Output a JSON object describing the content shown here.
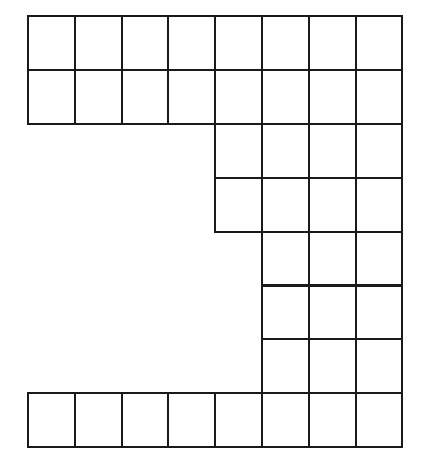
{
  "figure": {
    "background_color": "#ffffff",
    "line_color": "#1a1a1a",
    "line_width": 2.1,
    "origin_x": 28,
    "origin_y": 16,
    "cell_width": 46.8,
    "cell_height": 53.9,
    "columns": 8,
    "rows": 8,
    "total_filled_cells": 37,
    "row_labels": [
      "1",
      "2",
      "3",
      "4",
      "5",
      "6",
      "7",
      "8"
    ],
    "column_labels": [
      "1",
      "2",
      "3",
      "4",
      "5",
      "6",
      "7",
      "8"
    ],
    "filled_cells": [
      {
        "row": 1,
        "col": 1
      },
      {
        "row": 1,
        "col": 2
      },
      {
        "row": 1,
        "col": 3
      },
      {
        "row": 1,
        "col": 4
      },
      {
        "row": 1,
        "col": 5
      },
      {
        "row": 1,
        "col": 6
      },
      {
        "row": 1,
        "col": 7
      },
      {
        "row": 1,
        "col": 8
      },
      {
        "row": 2,
        "col": 1
      },
      {
        "row": 2,
        "col": 2
      },
      {
        "row": 2,
        "col": 3
      },
      {
        "row": 2,
        "col": 4
      },
      {
        "row": 2,
        "col": 5
      },
      {
        "row": 2,
        "col": 6
      },
      {
        "row": 2,
        "col": 7
      },
      {
        "row": 2,
        "col": 8
      },
      {
        "row": 3,
        "col": 5
      },
      {
        "row": 3,
        "col": 6
      },
      {
        "row": 3,
        "col": 7
      },
      {
        "row": 3,
        "col": 8
      },
      {
        "row": 4,
        "col": 5
      },
      {
        "row": 4,
        "col": 6
      },
      {
        "row": 4,
        "col": 7
      },
      {
        "row": 4,
        "col": 8
      },
      {
        "row": 5,
        "col": 6
      },
      {
        "row": 5,
        "col": 7
      },
      {
        "row": 5,
        "col": 8
      },
      {
        "row": 6,
        "col": 6
      },
      {
        "row": 6,
        "col": 7
      },
      {
        "row": 6,
        "col": 8
      },
      {
        "row": 7,
        "col": 6
      },
      {
        "row": 7,
        "col": 7
      },
      {
        "row": 7,
        "col": 8
      },
      {
        "row": 8,
        "col": 1
      },
      {
        "row": 8,
        "col": 2
      },
      {
        "row": 8,
        "col": 3
      },
      {
        "row": 8,
        "col": 4
      },
      {
        "row": 8,
        "col": 5
      },
      {
        "row": 8,
        "col": 6
      },
      {
        "row": 8,
        "col": 7
      },
      {
        "row": 8,
        "col": 8
      }
    ]
  }
}
